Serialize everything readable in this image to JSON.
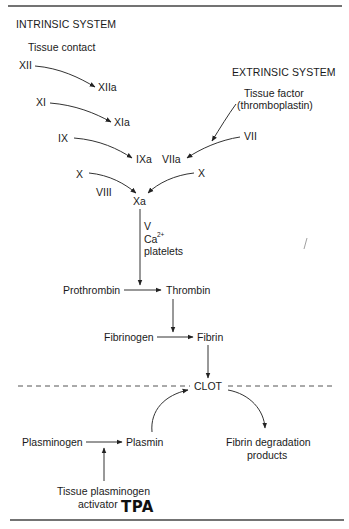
{
  "intrinsic": {
    "title": "INTRINSIC SYSTEM",
    "trigger": "Tissue contact",
    "factors": {
      "xii": "XII",
      "xiia": "XIIa",
      "xi": "XI",
      "xia": "XIa",
      "ix": "IX",
      "ixa": "IXa",
      "x_left": "X",
      "viii": "VIII"
    }
  },
  "extrinsic": {
    "title": "EXTRINSIC SYSTEM",
    "trigger_line1": "Tissue factor",
    "trigger_line2": "(thromboplastin)",
    "factors": {
      "vii": "VII",
      "viia": "VIIa",
      "x_right": "X"
    }
  },
  "common": {
    "xa": "Xa",
    "cofactors": {
      "v": "V",
      "ca": "Ca",
      "ca_charge": "2+",
      "platelets": "platelets"
    },
    "prothrombin": "Prothrombin",
    "thrombin": "Thrombin",
    "fibrinogen": "Fibrinogen",
    "fibrin": "Fibrin",
    "clot": "CLOT"
  },
  "fibrinolysis": {
    "plasminogen": "Plasminogen",
    "plasmin": "Plasmin",
    "degradation_line1": "Fibrin degradation",
    "degradation_line2": "products",
    "activator_line1": "Tissue plasminogen",
    "activator_line2": "activator",
    "handwritten_note": "TPA"
  }
}
